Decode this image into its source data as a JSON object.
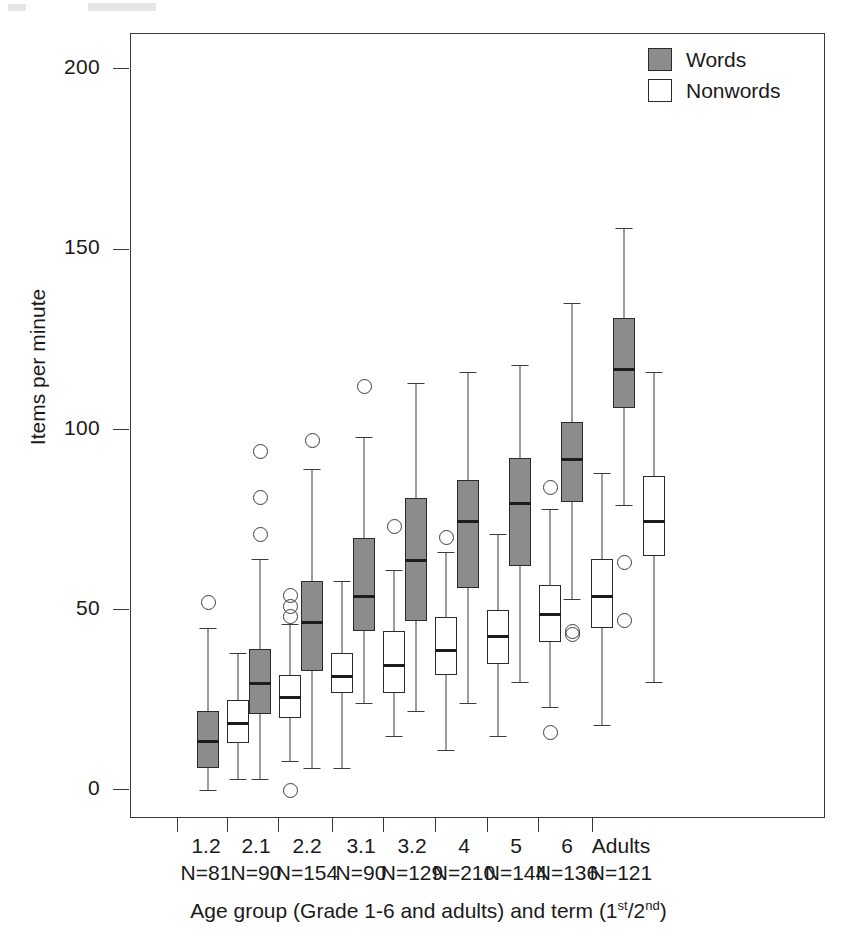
{
  "chart_data": {
    "type": "box",
    "title": "",
    "xlabel": "Age group (Grade 1-6 and adults) and term (1st/2nd)",
    "xlabel_parts": {
      "pre": "Age group (Grade 1-6 and adults) and term (1",
      "sup1": "st",
      "mid": "/2",
      "sup2": "nd",
      "post": ")"
    },
    "ylabel": "Items per minute",
    "ylim": [
      -18,
      218
    ],
    "yticks": [
      0,
      50,
      100,
      150,
      200
    ],
    "ytick_labels": [
      "0",
      "50",
      "100",
      "150",
      "200"
    ],
    "grid": false,
    "legend_position": "top-right",
    "legend": [
      {
        "name": "Words",
        "fill": "#8c8c8c",
        "stroke": "#2b2b2b"
      },
      {
        "name": "Nonwords",
        "fill": "#ffffff",
        "stroke": "#2b2b2b"
      }
    ],
    "categories": [
      "1.2",
      "2.1",
      "2.2",
      "3.1",
      "3.2",
      "4",
      "5",
      "6",
      "Adults"
    ],
    "category_counts": [
      "N=81",
      "N=90",
      "N=154",
      "N=90",
      "N=129",
      "N=210",
      "N=144",
      "N=136",
      "N=121"
    ],
    "series": [
      {
        "name": "Words",
        "boxes": [
          {
            "category": "1.2",
            "whisker_low": 0,
            "q1": 6,
            "median": 14,
            "q3": 22,
            "whisker_high": 45,
            "outliers": [
              52
            ]
          },
          {
            "category": "2.1",
            "whisker_low": 3,
            "q1": 21,
            "median": 30,
            "q3": 39,
            "whisker_high": 64,
            "outliers": [
              71,
              81,
              94
            ]
          },
          {
            "category": "2.2",
            "whisker_low": 6,
            "q1": 33,
            "median": 47,
            "q3": 58,
            "whisker_high": 89,
            "outliers": [
              97
            ]
          },
          {
            "category": "3.1",
            "whisker_low": 24,
            "q1": 44,
            "median": 54,
            "q3": 70,
            "whisker_high": 98,
            "outliers": [
              112
            ]
          },
          {
            "category": "3.2",
            "whisker_low": 22,
            "q1": 47,
            "median": 64,
            "q3": 81,
            "whisker_high": 113,
            "outliers": []
          },
          {
            "category": "4",
            "whisker_low": 24,
            "q1": 56,
            "median": 75,
            "q3": 86,
            "whisker_high": 116,
            "outliers": []
          },
          {
            "category": "5",
            "whisker_low": 30,
            "q1": 62,
            "median": 80,
            "q3": 92,
            "whisker_high": 118,
            "outliers": []
          },
          {
            "category": "6",
            "whisker_low": 53,
            "q1": 80,
            "median": 92,
            "q3": 102,
            "whisker_high": 135,
            "outliers": [
              44,
              43
            ]
          },
          {
            "category": "Adults",
            "whisker_low": 79,
            "q1": 106,
            "median": 117,
            "q3": 131,
            "whisker_high": 156,
            "outliers": [
              63,
              47
            ]
          }
        ]
      },
      {
        "name": "Nonwords",
        "boxes": [
          {
            "category": "1.2",
            "whisker_low": 3,
            "q1": 13,
            "median": 19,
            "q3": 25,
            "whisker_high": 38,
            "outliers": []
          },
          {
            "category": "2.1",
            "whisker_low": 8,
            "q1": 20,
            "median": 26,
            "q3": 32,
            "whisker_high": 46,
            "outliers": [
              48,
              51,
              54,
              0
            ]
          },
          {
            "category": "2.2",
            "whisker_low": 6,
            "q1": 27,
            "median": 32,
            "q3": 38,
            "whisker_high": 58,
            "outliers": []
          },
          {
            "category": "3.1",
            "whisker_low": 15,
            "q1": 27,
            "median": 35,
            "q3": 44,
            "whisker_high": 61,
            "outliers": [
              73
            ]
          },
          {
            "category": "3.2",
            "whisker_low": 11,
            "q1": 32,
            "median": 39,
            "q3": 48,
            "whisker_high": 66,
            "outliers": [
              70
            ]
          },
          {
            "category": "4",
            "whisker_low": 15,
            "q1": 35,
            "median": 43,
            "q3": 50,
            "whisker_high": 71,
            "outliers": []
          },
          {
            "category": "5",
            "whisker_low": 23,
            "q1": 41,
            "median": 49,
            "q3": 57,
            "whisker_high": 78,
            "outliers": [
              84,
              16
            ]
          },
          {
            "category": "6",
            "whisker_low": 18,
            "q1": 45,
            "median": 54,
            "q3": 64,
            "whisker_high": 88,
            "outliers": []
          },
          {
            "category": "Adults",
            "whisker_low": 30,
            "q1": 65,
            "median": 75,
            "q3": 87,
            "whisker_high": 116,
            "outliers": []
          }
        ]
      }
    ]
  }
}
